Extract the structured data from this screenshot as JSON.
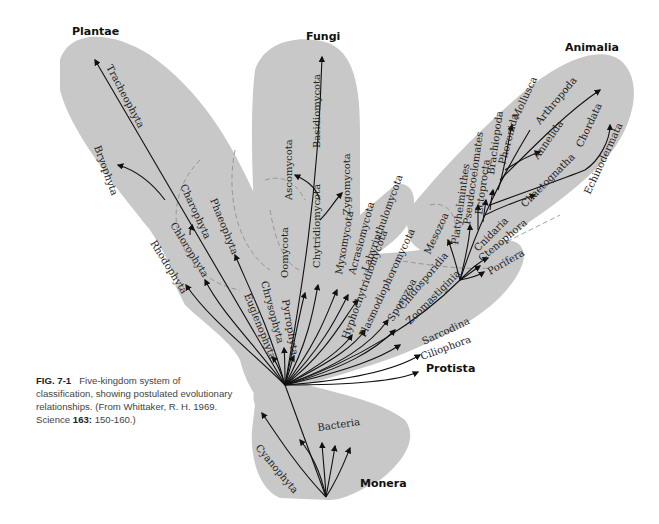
{
  "kingdoms": {
    "plantae": "Plantae",
    "fungi": "Fungi",
    "animalia": "Animalia",
    "protista": "Protista",
    "monera": "Monera"
  },
  "taxa": {
    "plantae": [
      "Tracheophyta",
      "Bryophyta",
      "Charophyta",
      "Chlorophyta",
      "Rhodophyta",
      "Phaeophyta"
    ],
    "fungi": [
      "Basidiomycota",
      "Ascomycota",
      "Zygomycota",
      "Chytridiomycota",
      "Oomycota",
      "Myxomycota",
      "Acrasiomycota",
      "Labyrinthulomycota"
    ],
    "protista": [
      "Euglenophyta",
      "Chrysophyta",
      "Pyrrophyta",
      "Hyphochytridiomycota",
      "Plasmodiophoromycota",
      "Sporozoa",
      "Cnidosporidia",
      "Zoomastiginia",
      "Sarcodina",
      "Ciliophora"
    ],
    "animalia": [
      "Mesozoa",
      "Platyhelminthes",
      "Pseudocoelomates",
      "Ectoprocta",
      "Brachiopoda",
      "Phoronida",
      "Mollusca",
      "Arthropoda",
      "Annelida",
      "Chordata",
      "Echinodermata",
      "Chaetognatha",
      "Cnidaria",
      "Ctenophora",
      "Porifera"
    ],
    "monera": [
      "Bacteria",
      "Cyanophyta"
    ]
  },
  "caption": {
    "fig_label": "FIG. 7-1",
    "text": "Five-kingdom system of classification, showing postulated evolutionary relationships. (From Whittaker, R. H. 1969. Science ",
    "volume": "163:",
    "pages": " 150-160.)"
  },
  "colors": {
    "region_fill": "#c8c8c8",
    "branch": "#111111",
    "dashed_boundary": "#8a8a8a"
  }
}
